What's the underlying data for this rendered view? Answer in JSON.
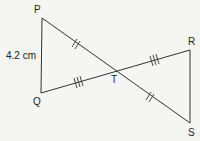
{
  "diagram": {
    "type": "geometry",
    "vertices": {
      "P": {
        "label": "P",
        "x": 42,
        "y": 18
      },
      "Q": {
        "label": "Q",
        "x": 41,
        "y": 93
      },
      "R": {
        "label": "R",
        "x": 190,
        "y": 50
      },
      "S": {
        "label": "S",
        "x": 190,
        "y": 123
      },
      "T": {
        "label": "T",
        "x": 116,
        "y": 70
      }
    },
    "side_label": {
      "segment": "PQ",
      "text": "4.2 cm"
    },
    "tick_marks": [
      {
        "segment": "PT",
        "count": 2
      },
      {
        "segment": "TS",
        "count": 2
      },
      {
        "segment": "QT",
        "count": 3
      },
      {
        "segment": "TR",
        "count": 3
      }
    ],
    "colors": {
      "line": "#333333",
      "background": "#f5f5f3"
    }
  }
}
